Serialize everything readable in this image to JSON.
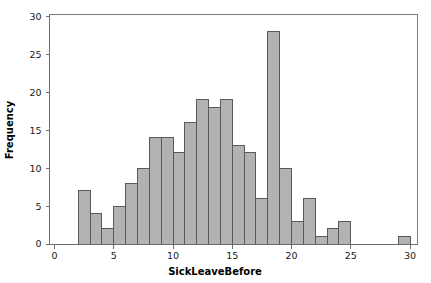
{
  "chart_data": {
    "type": "bar",
    "title": "",
    "subtitle": "",
    "xlabel": "SickLeaveBefore",
    "ylabel": "Frequency",
    "xlim": [
      0,
      31.5
    ],
    "ylim": [
      0,
      30
    ],
    "grid": false,
    "legend": null,
    "bin_width": 1,
    "x_ticks": [
      {
        "value": 0,
        "label": "0"
      },
      {
        "value": 5,
        "label": "5"
      },
      {
        "value": 10,
        "label": "10"
      },
      {
        "value": 15,
        "label": "15"
      },
      {
        "value": 20,
        "label": "20"
      },
      {
        "value": 25,
        "label": "25"
      },
      {
        "value": 30,
        "label": "30"
      }
    ],
    "y_ticks": [
      {
        "value": 0,
        "label": "0"
      },
      {
        "value": 5,
        "label": "5"
      },
      {
        "value": 10,
        "label": "10"
      },
      {
        "value": 15,
        "label": "15"
      },
      {
        "value": 20,
        "label": "20"
      },
      {
        "value": 25,
        "label": "25"
      },
      {
        "value": 30,
        "label": "30"
      }
    ],
    "bins": [
      {
        "bin_start": 2,
        "bin_end": 3,
        "value": 7
      },
      {
        "bin_start": 3,
        "bin_end": 4,
        "value": 4
      },
      {
        "bin_start": 4,
        "bin_end": 5,
        "value": 2
      },
      {
        "bin_start": 5,
        "bin_end": 6,
        "value": 5
      },
      {
        "bin_start": 6,
        "bin_end": 7,
        "value": 8
      },
      {
        "bin_start": 7,
        "bin_end": 8,
        "value": 10
      },
      {
        "bin_start": 8,
        "bin_end": 9,
        "value": 14
      },
      {
        "bin_start": 9,
        "bin_end": 10,
        "value": 14
      },
      {
        "bin_start": 10,
        "bin_end": 11,
        "value": 12
      },
      {
        "bin_start": 11,
        "bin_end": 12,
        "value": 16
      },
      {
        "bin_start": 12,
        "bin_end": 13,
        "value": 19
      },
      {
        "bin_start": 13,
        "bin_end": 14,
        "value": 18
      },
      {
        "bin_start": 14,
        "bin_end": 15,
        "value": 19
      },
      {
        "bin_start": 15,
        "bin_end": 16,
        "value": 13
      },
      {
        "bin_start": 16,
        "bin_end": 17,
        "value": 12
      },
      {
        "bin_start": 17,
        "bin_end": 18,
        "value": 6
      },
      {
        "bin_start": 18,
        "bin_end": 19,
        "value": 28
      },
      {
        "bin_start": 19,
        "bin_end": 20,
        "value": 10
      },
      {
        "bin_start": 20,
        "bin_end": 21,
        "value": 3
      },
      {
        "bin_start": 21,
        "bin_end": 22,
        "value": 6
      },
      {
        "bin_start": 22,
        "bin_end": 23,
        "value": 1
      },
      {
        "bin_start": 23,
        "bin_end": 24,
        "value": 2
      },
      {
        "bin_start": 24,
        "bin_end": 25,
        "value": 3
      },
      {
        "bin_start": 29,
        "bin_end": 30,
        "value": 1
      }
    ],
    "categories": [
      "2-3",
      "3-4",
      "4-5",
      "5-6",
      "6-7",
      "7-8",
      "8-9",
      "9-10",
      "10-11",
      "11-12",
      "12-13",
      "13-14",
      "14-15",
      "15-16",
      "16-17",
      "17-18",
      "18-19",
      "19-20",
      "20-21",
      "21-22",
      "22-23",
      "23-24",
      "24-25",
      "29-30"
    ],
    "values": [
      7,
      4,
      2,
      5,
      8,
      10,
      14,
      14,
      12,
      16,
      19,
      18,
      19,
      13,
      12,
      6,
      28,
      10,
      3,
      6,
      1,
      2,
      3,
      1
    ],
    "colors": {
      "bar_fill": "#b2b2b2",
      "bar_stroke": "#5a5a5a",
      "frame": "#7a7a7a",
      "axis": "#6e6e6e",
      "text": "#1a1a1a",
      "background": "#ffffff"
    }
  }
}
